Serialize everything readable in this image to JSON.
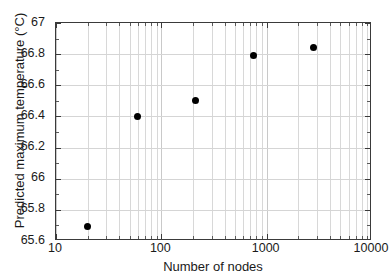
{
  "chart_data": {
    "type": "scatter",
    "title": "",
    "xlabel": "Number of nodes",
    "ylabel": "Predicted maximum temperature (°C)",
    "xscale": "log",
    "yscale": "linear",
    "xlim": [
      10,
      10000
    ],
    "ylim": [
      65.6,
      67
    ],
    "grid": true,
    "legend": null,
    "marker": {
      "shape": "circle",
      "color": "#000000",
      "size_px": 7
    },
    "x_tick_labels": [
      "10",
      "100",
      "1000",
      "10000"
    ],
    "x_tick_values": [
      10,
      100,
      1000,
      10000
    ],
    "y_tick_labels": [
      "65.6",
      "65.8",
      "66",
      "66.2",
      "66.4",
      "66.6",
      "66.8",
      "67"
    ],
    "y_tick_values": [
      65.6,
      65.8,
      66,
      66.2,
      66.4,
      66.6,
      66.8,
      67
    ],
    "x": [
      20,
      60,
      210,
      750,
      2800,
      10500
    ],
    "y": [
      65.69,
      66.4,
      66.5,
      66.79,
      66.84,
      66.85
    ],
    "points": [
      {
        "x": 20,
        "y": 65.69
      },
      {
        "x": 60,
        "y": 66.4
      },
      {
        "x": 210,
        "y": 66.5
      },
      {
        "x": 750,
        "y": 66.79
      },
      {
        "x": 2800,
        "y": 66.84
      },
      {
        "x": 10500,
        "y": 66.85
      }
    ],
    "series": [
      {
        "name": "Predicted maximum temperature",
        "x": [
          20,
          60,
          210,
          750,
          2800,
          10500
        ],
        "values": [
          65.69,
          66.4,
          66.5,
          66.79,
          66.84,
          66.85
        ]
      }
    ],
    "colors": {
      "marker": "#000000",
      "axis": "#3a3a3a",
      "grid_major": "#c9c9c9",
      "grid_minor": "#d8d8d8",
      "background": "#ffffff",
      "text": "#1a1a1a"
    }
  }
}
